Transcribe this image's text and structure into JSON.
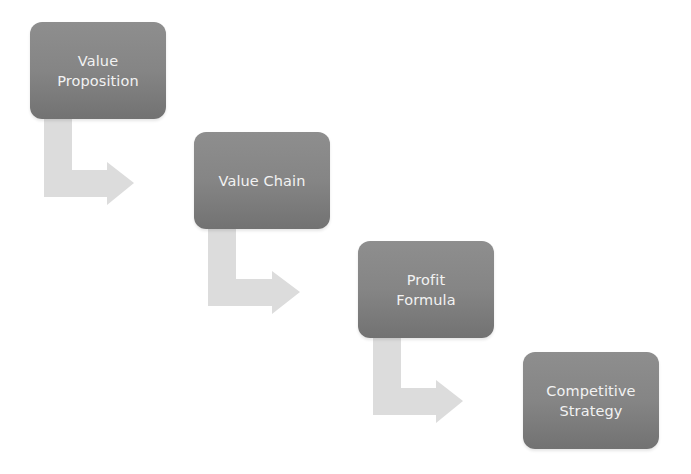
{
  "diagram": {
    "type": "staircase-process",
    "colors": {
      "box_top": "#8e8e8e",
      "box_bottom": "#727272",
      "box_text": "#f2f2f2",
      "arrow": "#dcdcdc",
      "background": "#ffffff"
    },
    "steps": [
      {
        "label": "Value\nProposition"
      },
      {
        "label": "Value Chain"
      },
      {
        "label": "Profit\nFormula"
      },
      {
        "label": "Competitive\nStrategy"
      }
    ],
    "connectors": [
      {
        "from": 0,
        "to": 1,
        "icon": "bent-arrow-right-icon"
      },
      {
        "from": 1,
        "to": 2,
        "icon": "bent-arrow-right-icon"
      },
      {
        "from": 2,
        "to": 3,
        "icon": "bent-arrow-right-icon"
      }
    ]
  }
}
